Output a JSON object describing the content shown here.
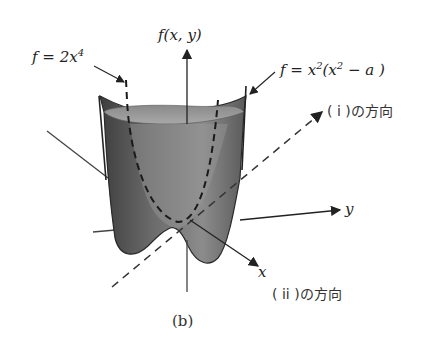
{
  "figure": {
    "caption": "(b)",
    "axes": {
      "vertical_label": "f(x, y)",
      "x_label": "x",
      "y_label": "y"
    },
    "annotations": {
      "quartic": {
        "lhs": "f = 2x",
        "exp": "4"
      },
      "saddle": {
        "lhs": "f = x",
        "exp1": "2",
        "mid": "(x",
        "exp2": "2",
        "rhs": " − a )"
      },
      "direction_i": "( i )の方向",
      "direction_ii": "( ii )の方向"
    },
    "colors": {
      "surface_dark": "#4a4a4a",
      "surface_mid": "#7a7a7a",
      "surface_light": "#9a9a9a",
      "line": "#222222"
    }
  }
}
